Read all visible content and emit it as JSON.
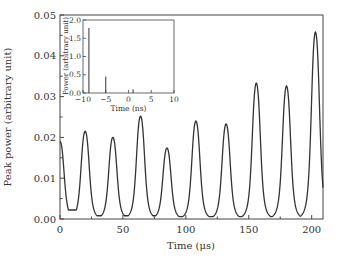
{
  "chart_data": [
    {
      "type": "line",
      "title": "",
      "xlabel": "Time (μs)",
      "ylabel": "Peak power (arbitrary unit)",
      "xlim": [
        0,
        209
      ],
      "ylim": [
        0,
        0.05
      ],
      "xticks": [
        "0",
        "50",
        "100",
        "150",
        "200"
      ],
      "yticks": [
        "0.00",
        "0.01",
        "0.02",
        "0.03",
        "0.04",
        "0.05"
      ],
      "grid": false,
      "legend": null,
      "series": [
        {
          "name": "peak power",
          "peaks": [
            {
              "t": 0,
              "v": 0.019
            },
            {
              "t": 20,
              "v": 0.0215
            },
            {
              "t": 42,
              "v": 0.02
            },
            {
              "t": 64,
              "v": 0.0252
            },
            {
              "t": 85,
              "v": 0.0174
            },
            {
              "t": 108,
              "v": 0.024
            },
            {
              "t": 132,
              "v": 0.0233
            },
            {
              "t": 156,
              "v": 0.0333
            },
            {
              "t": 180,
              "v": 0.0326
            },
            {
              "t": 203,
              "v": 0.0458
            }
          ],
          "minima": [
            {
              "t": 10,
              "v": 0.0022
            },
            {
              "t": 31,
              "v": 0.0008
            },
            {
              "t": 53,
              "v": 0.0008
            },
            {
              "t": 75,
              "v": 0.0008
            },
            {
              "t": 97,
              "v": 0.0006
            },
            {
              "t": 120,
              "v": 0.0006
            },
            {
              "t": 144,
              "v": 0.0006
            },
            {
              "t": 168,
              "v": 0.0006
            },
            {
              "t": 192,
              "v": 0.0006
            }
          ]
        }
      ]
    },
    {
      "type": "bar",
      "role": "inset",
      "title": "",
      "xlabel": "Time (ns)",
      "ylabel": "Power (arbitrary unit)",
      "xlim": [
        -10,
        10
      ],
      "ylim": [
        0,
        2.0
      ],
      "xticks": [
        "−10",
        "−5",
        "0",
        "5",
        "10"
      ],
      "yticks": [
        "0.0",
        "0.5",
        "1.0",
        "1.5",
        "2.0"
      ],
      "grid": false,
      "series": [
        {
          "name": "pulse spikes",
          "x": [
            -8.7,
            -5.0,
            1.0
          ],
          "values": [
            1.78,
            0.45,
            0.1
          ]
        }
      ]
    }
  ]
}
